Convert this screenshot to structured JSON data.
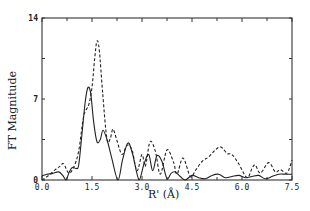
{
  "chart_data": {
    "type": "line",
    "title": "",
    "xlabel": "R' (Å)",
    "ylabel": "FT Magnitude",
    "xlim": [
      0,
      7.5
    ],
    "ylim": [
      0,
      14
    ],
    "xticks": [
      "0.0",
      "1.5",
      "3.0",
      "4.5",
      "6.0",
      "7.5"
    ],
    "xtick_values": [
      0,
      1.5,
      3.0,
      4.5,
      6.0,
      7.5
    ],
    "yticks": [
      "0",
      "7",
      "14"
    ],
    "ytick_values": [
      0,
      7,
      14
    ],
    "grid": false,
    "legend": null,
    "series": [
      {
        "name": "solid",
        "style": "solid",
        "x": [
          0.0,
          0.15,
          0.3,
          0.5,
          0.62,
          0.72,
          0.82,
          0.92,
          1.02,
          1.1,
          1.2,
          1.3,
          1.38,
          1.46,
          1.55,
          1.65,
          1.75,
          1.83,
          1.95,
          2.1,
          2.28,
          2.42,
          2.58,
          2.72,
          2.91,
          3.05,
          3.2,
          3.32,
          3.45,
          3.6,
          3.75,
          3.88,
          4.0,
          4.15,
          4.3,
          4.5,
          4.7,
          4.9,
          5.1,
          5.3,
          5.5,
          5.7,
          5.9,
          6.1,
          6.3,
          6.5,
          6.7,
          6.9,
          7.1,
          7.3,
          7.5
        ],
        "y": [
          0.35,
          0.5,
          0.55,
          0.7,
          0.4,
          0.0,
          0.7,
          1.1,
          1.0,
          1.3,
          4.0,
          6.8,
          8.0,
          7.5,
          5.0,
          3.3,
          3.5,
          4.3,
          3.5,
          1.8,
          0.0,
          1.8,
          3.2,
          2.2,
          0.0,
          1.3,
          2.2,
          0.8,
          2.1,
          1.6,
          0.1,
          0.6,
          0.7,
          0.3,
          0.0,
          0.4,
          0.2,
          0.1,
          0.4,
          0.5,
          0.2,
          0.3,
          0.4,
          0.2,
          0.3,
          0.4,
          0.1,
          0.3,
          0.5,
          0.5,
          0.5
        ]
      },
      {
        "name": "dashed",
        "style": "dashed",
        "x": [
          0.0,
          0.2,
          0.4,
          0.55,
          0.65,
          0.8,
          0.95,
          1.1,
          1.25,
          1.4,
          1.5,
          1.58,
          1.65,
          1.72,
          1.82,
          1.95,
          2.05,
          2.13,
          2.25,
          2.4,
          2.55,
          2.7,
          2.85,
          3.0,
          3.1,
          3.24,
          3.4,
          3.55,
          3.75,
          3.95,
          4.05,
          4.23,
          4.45,
          4.6,
          4.8,
          5.0,
          5.2,
          5.37,
          5.55,
          5.7,
          5.9,
          6.15,
          6.3,
          6.4,
          6.55,
          6.8,
          7.0,
          7.15,
          7.35,
          7.5
        ],
        "y": [
          0.0,
          0.4,
          0.9,
          1.2,
          1.4,
          0.6,
          1.1,
          2.5,
          5.5,
          6.5,
          8.0,
          10.5,
          12.0,
          11.2,
          7.5,
          3.5,
          3.6,
          4.4,
          3.4,
          2.2,
          3.0,
          2.6,
          0.8,
          2.2,
          1.2,
          3.3,
          2.5,
          0.5,
          2.6,
          1.5,
          0.5,
          1.9,
          0.3,
          0.8,
          1.6,
          2.0,
          2.6,
          2.85,
          2.3,
          2.2,
          1.4,
          0.2,
          1.0,
          1.3,
          0.6,
          1.5,
          0.7,
          0.9,
          0.6,
          1.7
        ]
      }
    ]
  }
}
